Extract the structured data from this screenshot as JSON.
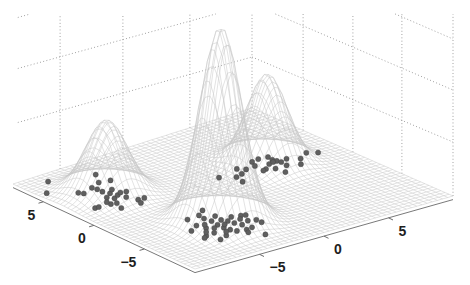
{
  "figure": {
    "width": 470,
    "height": 285,
    "background": "#ffffff"
  },
  "chart_data": {
    "type": "scatter",
    "view": "3d",
    "title": "",
    "xlabel": "",
    "ylabel": "",
    "zlabel": "",
    "grid": true,
    "x_axis": {
      "position": "front-right edge",
      "lim": [
        -10,
        10
      ],
      "ticks": [
        -5,
        0,
        5
      ],
      "tick_labels": [
        "−5",
        "0",
        "5"
      ]
    },
    "y_axis": {
      "position": "front-left edge",
      "lim": [
        -10,
        8
      ],
      "ticks": [
        -5,
        0,
        5
      ],
      "tick_labels": [
        "−5",
        "0",
        "5"
      ]
    },
    "z_axis": {
      "tick_labels_visible": false,
      "gridline_levels": [
        1,
        2,
        3
      ]
    },
    "surface": {
      "type": "mesh",
      "description": "Gaussian mixture density drawn as wireframe mesh",
      "grid_size": 50,
      "components": [
        {
          "name": "tall-peak",
          "x": -3.8,
          "y": -4.8,
          "height": 3.75,
          "sigma_x": 1.3,
          "sigma_y": 1.3
        },
        {
          "name": "right-peak",
          "x": 4.8,
          "y": 0.9,
          "height": 1.7,
          "sigma_x": 1.25,
          "sigma_y": 1.25
        },
        {
          "name": "left-peak",
          "x": -6.3,
          "y": 3.2,
          "height": 1.4,
          "sigma_x": 1.35,
          "sigma_y": 1.35
        }
      ]
    },
    "series": [
      {
        "name": "samples",
        "marker": "filled-circle",
        "z": 0,
        "points": [
          [
            -8.0,
            6.9
          ],
          [
            -9.3,
            5.5
          ],
          [
            -7.7,
            4.3
          ],
          [
            -7.5,
            4.0
          ],
          [
            -6.5,
            4.4
          ],
          [
            -4.9,
            5.9
          ],
          [
            -5.6,
            4.8
          ],
          [
            -4.8,
            4.6
          ],
          [
            -6.4,
            4.0
          ],
          [
            -6.4,
            3.5
          ],
          [
            -6.8,
            2.6
          ],
          [
            -6.2,
            3.0
          ],
          [
            -5.7,
            3.4
          ],
          [
            -6.5,
            2.2
          ],
          [
            -6.0,
            2.5
          ],
          [
            -5.6,
            2.7
          ],
          [
            -5.2,
            2.6
          ],
          [
            -5.8,
            1.9
          ],
          [
            -7.3,
            1.6
          ],
          [
            -6.9,
            1.5
          ],
          [
            -7.2,
            0.7
          ],
          [
            -8.5,
            1.7
          ],
          [
            -8.2,
            1.7
          ],
          [
            -5.5,
            1.1
          ],
          [
            -5.0,
            1.1
          ],
          [
            -5.7,
            0.6
          ],
          [
            -7.3,
            2.0
          ],
          [
            -3.5,
            -2.7
          ],
          [
            -5.2,
            -3.3
          ],
          [
            -6.2,
            -4.9
          ],
          [
            -5.4,
            -4.4
          ],
          [
            -4.3,
            -3.8
          ],
          [
            -5.2,
            -5.1
          ],
          [
            -4.2,
            -4.4
          ],
          [
            -5.3,
            -6.0
          ],
          [
            -4.3,
            -5.1
          ],
          [
            -3.6,
            -4.6
          ],
          [
            -4.3,
            -5.7
          ],
          [
            -3.4,
            -5.0
          ],
          [
            -4.2,
            -6.2
          ],
          [
            -3.3,
            -5.5
          ],
          [
            -4.0,
            -6.6
          ],
          [
            -2.2,
            -4.8
          ],
          [
            -3.1,
            -6.0
          ],
          [
            -3.4,
            -6.8
          ],
          [
            -2.4,
            -5.7
          ],
          [
            -2.9,
            -6.7
          ],
          [
            -1.9,
            -5.9
          ],
          [
            -1.9,
            -6.4
          ],
          [
            -3.0,
            -8.1
          ],
          [
            -5.7,
            -7.1
          ],
          [
            -6.0,
            -6.1
          ],
          [
            -1.9,
            -4.9
          ],
          [
            -5.0,
            -6.8
          ],
          [
            -3.5,
            -3.9
          ],
          [
            -4.2,
            -3.2
          ],
          [
            -6.3,
            -6.3
          ],
          [
            -4.8,
            -5.4
          ],
          [
            -3.9,
            -5.3
          ],
          [
            -2.6,
            -5.2
          ],
          [
            -4.6,
            -6.3
          ],
          [
            -3.6,
            -7.2
          ],
          [
            -5.6,
            -5.6
          ],
          [
            -2.8,
            -4.6
          ],
          [
            -4.9,
            -4.6
          ],
          [
            7.7,
            0.6
          ],
          [
            8.3,
            0.2
          ],
          [
            6.8,
            0.1
          ],
          [
            6.2,
            -0.6
          ],
          [
            5.4,
            -0.2
          ],
          [
            4.6,
            -1.0
          ],
          [
            5.3,
            1.0
          ],
          [
            5.4,
            0.7
          ],
          [
            4.5,
            -0.2
          ],
          [
            4.7,
            0.6
          ],
          [
            4.0,
            0.1
          ],
          [
            3.7,
            0.0
          ],
          [
            4.7,
            1.6
          ],
          [
            4.1,
            1.5
          ],
          [
            3.8,
            0.9
          ],
          [
            3.0,
            0.8
          ],
          [
            2.6,
            1.2
          ],
          [
            2.3,
            0.4
          ],
          [
            1.7,
            0.2
          ],
          [
            1.5,
            -0.6
          ],
          [
            5.4,
            1.5
          ],
          [
            5.5,
            0.4
          ],
          [
            5.1,
            0.7
          ],
          [
            0.8,
            0.8
          ],
          [
            6.1,
            0.6
          ]
        ]
      }
    ],
    "colors": {
      "mesh": "#c6c6c6",
      "points_fill": "#5f5f5f",
      "points_edge": "#3e3e3e",
      "wall_grid": "#8c8c8c",
      "axis": "#6a6a6a",
      "tick_label": "#1e1e1e"
    }
  }
}
